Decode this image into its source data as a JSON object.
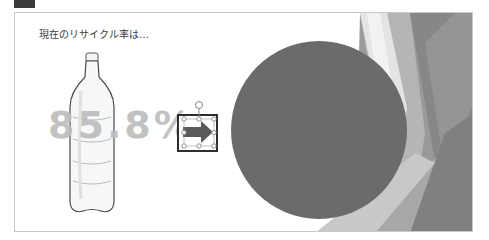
{
  "slide": {
    "title": "現在のリサイクル率は…",
    "percent_value": "85.8%",
    "selected_shape": "right-arrow",
    "colors": {
      "circle": "#6b6b6b",
      "percent_text": "#bdbdbd",
      "frame": "#2e2e2e",
      "background": "#ffffff"
    }
  },
  "icons": {
    "bottle": "plastic-bottle-icon",
    "arrow": "right-arrow-icon",
    "rotate_handle": "rotate-handle-icon"
  }
}
